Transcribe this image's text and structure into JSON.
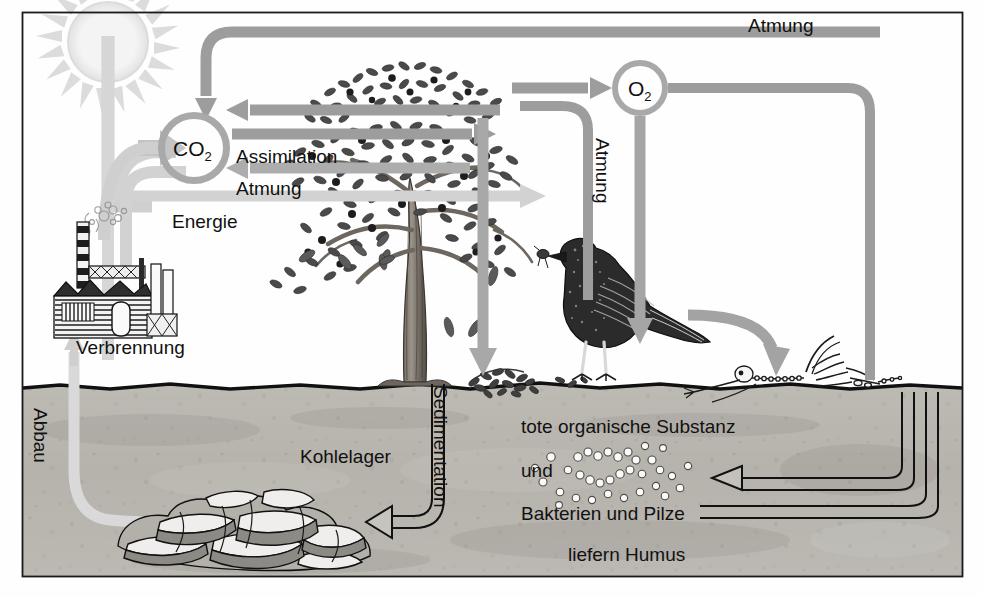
{
  "diagram": {
    "language": "de",
    "frame": {
      "x": 22,
      "y": 12,
      "width": 941,
      "height": 565,
      "border_color": "#1a1a1a"
    },
    "palette": {
      "arrow_gray": "#9a9a9a",
      "arrow_gray_dark": "#8a8a8a",
      "arrow_gray_light": "#c8c8c8",
      "sun_gray": "#dcdcdc",
      "soil_gray": "#b9b6b0",
      "soil_gray_dark": "#a8a49d",
      "text_black": "#111111",
      "ink": "#2b2b2b",
      "paper": "#fefefe"
    },
    "ground_line_y": 386
  },
  "nodes": [
    {
      "id": "co2",
      "label": "CO",
      "subscript": "2",
      "type": "pool-circle",
      "cx": 194,
      "cy": 148,
      "r": 36
    },
    {
      "id": "o2",
      "label": "O",
      "subscript": "2",
      "type": "pool-circle",
      "cx": 640,
      "cy": 88,
      "r": 28
    }
  ],
  "labels": [
    {
      "id": "atmung-top",
      "text": "Atmung",
      "x": 748,
      "y": 18,
      "rotate": 0,
      "size": 19
    },
    {
      "id": "assimilation",
      "text": "Assimilation",
      "x": 236,
      "y": 147,
      "rotate": 0,
      "size": 19
    },
    {
      "id": "atmung-plant",
      "text": "Atmung",
      "x": 236,
      "y": 179,
      "rotate": 0,
      "size": 19
    },
    {
      "id": "energie",
      "text": "Energie",
      "x": 172,
      "y": 212,
      "rotate": 0,
      "size": 19
    },
    {
      "id": "atmung-animal",
      "text": "Atmung",
      "x": 604,
      "y": 138,
      "rotate": 90,
      "size": 19
    },
    {
      "id": "verbrennung",
      "text": "Verbrennung",
      "x": 76,
      "y": 338,
      "rotate": 0,
      "size": 19
    },
    {
      "id": "abbau",
      "text": "Abbau",
      "x": 42,
      "y": 408,
      "rotate": 90,
      "size": 19
    },
    {
      "id": "kohlelager",
      "text": "Kohlelager",
      "x": 300,
      "y": 447,
      "rotate": 0,
      "size": 19
    },
    {
      "id": "sedimentation",
      "text": "Sedimentation",
      "x": 440,
      "y": 386,
      "rotate": 90,
      "size": 19
    },
    {
      "id": "tote-substanz",
      "text": "tote organische Substanz",
      "x": 521,
      "y": 417,
      "rotate": 0,
      "size": 19
    },
    {
      "id": "und",
      "text": "und",
      "x": 521,
      "y": 461,
      "rotate": 0,
      "size": 19
    },
    {
      "id": "bakterien",
      "text": "Bakterien  und  Pilze",
      "x": 521,
      "y": 504,
      "rotate": 0,
      "size": 19
    },
    {
      "id": "liefern-humus",
      "text": "liefern Humus",
      "x": 568,
      "y": 545,
      "rotate": 0,
      "size": 19
    }
  ],
  "illustrations": [
    {
      "id": "sun",
      "name": "sun",
      "cx": 108,
      "cy": 45,
      "r": 42
    },
    {
      "id": "tree",
      "name": "deciduous-tree",
      "cx": 415,
      "cy": 220
    },
    {
      "id": "factory",
      "name": "factory-smokestack",
      "cx": 110,
      "cy": 300
    },
    {
      "id": "bird",
      "name": "bird-with-insect",
      "cx": 620,
      "cy": 305
    },
    {
      "id": "skeleton",
      "name": "animal-skeleton",
      "cx": 820,
      "cy": 370
    },
    {
      "id": "coal-seam",
      "name": "coal-deposit-rocks",
      "cx": 200,
      "cy": 520
    },
    {
      "id": "microbes",
      "name": "bacteria-fungi-dots",
      "cx": 620,
      "cy": 470
    },
    {
      "id": "litter",
      "name": "leaf-litter",
      "cx": 520,
      "cy": 382
    }
  ],
  "flows": [
    {
      "id": "sun-to-co2",
      "from": "sun",
      "to": "co2",
      "label": "Energie",
      "style": "thick-light"
    },
    {
      "id": "atmung-loop-top",
      "from": "right",
      "to": "co2",
      "label": "Atmung",
      "style": "thick-gray"
    },
    {
      "id": "assimilation",
      "from": "co2",
      "to": "tree",
      "label": "Assimilation",
      "style": "thick-gray"
    },
    {
      "id": "atmung-plant",
      "from": "tree",
      "to": "co2",
      "label": "Atmung",
      "style": "thick-gray"
    },
    {
      "id": "tree-to-o2",
      "from": "tree",
      "to": "o2",
      "label": "",
      "style": "thick-gray"
    },
    {
      "id": "o2-to-bird",
      "from": "o2",
      "to": "bird",
      "label": "",
      "style": "thick-gray"
    },
    {
      "id": "atmung-animal",
      "from": "bird",
      "to": "o2",
      "label": "Atmung",
      "style": "thick-gray"
    },
    {
      "id": "leaf-fall",
      "from": "tree",
      "to": "litter",
      "label": "",
      "style": "thick-gray"
    },
    {
      "id": "bird-to-skeleton",
      "from": "bird",
      "to": "skeleton",
      "label": "",
      "style": "thick-gray"
    },
    {
      "id": "sedimentation",
      "from": "surface",
      "to": "coal-seam",
      "label": "Sedimentation",
      "style": "outline"
    },
    {
      "id": "abbau",
      "from": "coal-seam",
      "to": "factory",
      "label": "Abbau",
      "style": "thick-light"
    },
    {
      "id": "verbrennung",
      "from": "factory",
      "to": "co2",
      "label": "Verbrennung",
      "style": "thick-light"
    },
    {
      "id": "humus-return-a",
      "from": "right",
      "to": "microbes",
      "label": "",
      "style": "outline"
    },
    {
      "id": "humus-return-b",
      "from": "right",
      "to": "microbes",
      "label": "",
      "style": "outline"
    }
  ]
}
